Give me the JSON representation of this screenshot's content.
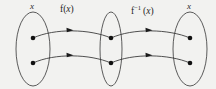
{
  "figure": {
    "type": "function-inverse-mapping-diagram",
    "background_color": "#f2f2f0",
    "stroke_color": "#4a4a4a",
    "dot_color": "#111111",
    "width": 216,
    "height": 89
  },
  "sets": [
    {
      "id": "domain",
      "label": "x",
      "label_is_italic": true,
      "cx": 33,
      "cy": 49,
      "rx": 17,
      "ry": 37,
      "elements": [
        {
          "cx": 33,
          "cy": 38
        },
        {
          "cx": 33,
          "cy": 63
        }
      ]
    },
    {
      "id": "codomain",
      "label": "",
      "label_is_italic": true,
      "cx": 111,
      "cy": 49,
      "rx": 11,
      "ry": 37,
      "elements": [
        {
          "cx": 111,
          "cy": 38
        },
        {
          "cx": 111,
          "cy": 63
        }
      ]
    },
    {
      "id": "range",
      "label": "x",
      "label_is_italic": true,
      "cx": 190,
      "cy": 49,
      "rx": 17,
      "ry": 37,
      "elements": [
        {
          "cx": 190,
          "cy": 38
        },
        {
          "cx": 190,
          "cy": 63
        }
      ]
    }
  ],
  "mappings": [
    {
      "id": "forward",
      "label_prefix": "f(",
      "label_var": "x",
      "label_suffix": ")",
      "label_exponent": "",
      "label_x": 61,
      "label_y": 6,
      "arrows": [
        {
          "from_x": 37,
          "from_y": 37,
          "to_x": 108,
          "to_y": 37,
          "bow": -5,
          "head_x": 70,
          "head_y": 28
        },
        {
          "from_x": 37,
          "from_y": 62,
          "to_x": 108,
          "to_y": 62,
          "bow": -5,
          "head_x": 70,
          "head_y": 53
        }
      ]
    },
    {
      "id": "inverse",
      "label_prefix": "f",
      "label_var": "x",
      "label_suffix": "(x)",
      "label_exponent": "−1",
      "label_x": 131,
      "label_y": 6,
      "arrows": [
        {
          "from_x": 115,
          "from_y": 37,
          "to_x": 187,
          "to_y": 37,
          "bow": -5,
          "head_x": 152,
          "head_y": 28
        },
        {
          "from_x": 115,
          "from_y": 62,
          "to_x": 187,
          "to_y": 62,
          "bow": -5,
          "head_x": 152,
          "head_y": 53
        }
      ]
    }
  ],
  "labels": {
    "domain_set": "x",
    "range_set": "x",
    "forward_map": "f(x)",
    "inverse_map": "f⁻¹ (x)"
  }
}
